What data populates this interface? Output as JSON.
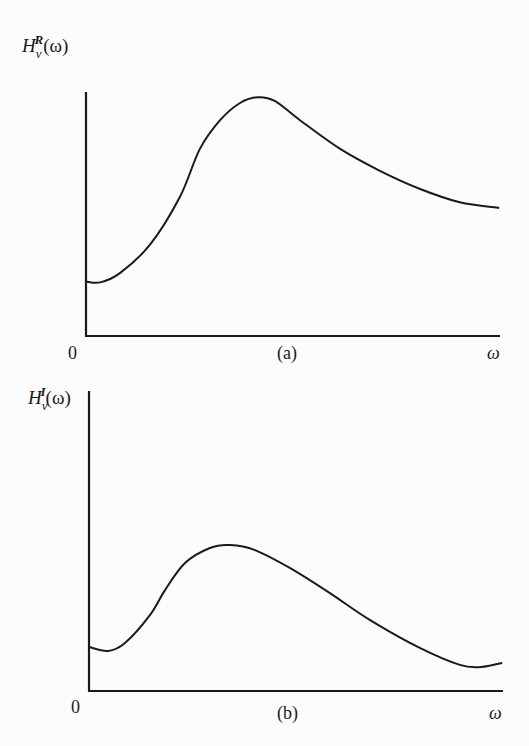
{
  "chart_data": [
    {
      "type": "line",
      "panel_label": "(a)",
      "ylabel": {
        "base": "H",
        "sub": "v",
        "sup": "R",
        "arg": "(ω)"
      },
      "xlabel": "ω",
      "origin_label": "0",
      "xlim": [
        0,
        1
      ],
      "ylim": [
        0,
        1
      ],
      "grid": false,
      "ticks": "none",
      "series": [
        {
          "name": "H_v^R(ω)",
          "x": [
            0.0,
            0.034,
            0.082,
            0.155,
            0.227,
            0.275,
            0.324,
            0.372,
            0.415,
            0.457,
            0.517,
            0.614,
            0.71,
            0.807,
            0.903,
            0.998
          ],
          "y": [
            0.234,
            0.23,
            0.27,
            0.393,
            0.598,
            0.803,
            0.926,
            1.0,
            1.025,
            1.008,
            0.926,
            0.803,
            0.709,
            0.631,
            0.574,
            0.549
          ]
        }
      ]
    },
    {
      "type": "line",
      "panel_label": "(b)",
      "ylabel": {
        "base": "H",
        "sub": "v",
        "sup": "I",
        "arg": "(ω)"
      },
      "xlabel": "ω",
      "origin_label": "0",
      "xlim": [
        0,
        1
      ],
      "ylim": [
        0,
        1
      ],
      "grid": false,
      "ticks": "none",
      "series": [
        {
          "name": "H_v^I(ω)",
          "x": [
            0.0,
            0.046,
            0.087,
            0.147,
            0.184,
            0.232,
            0.292,
            0.341,
            0.401,
            0.485,
            0.582,
            0.679,
            0.799,
            0.896,
            0.947,
            0.998
          ],
          "y": [
            0.15,
            0.137,
            0.164,
            0.259,
            0.345,
            0.437,
            0.488,
            0.498,
            0.481,
            0.42,
            0.334,
            0.242,
            0.147,
            0.089,
            0.082,
            0.096
          ]
        }
      ]
    }
  ]
}
